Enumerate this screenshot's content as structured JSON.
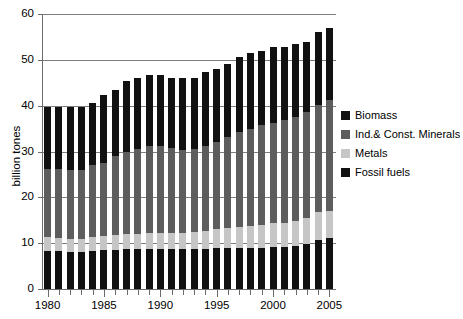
{
  "figure": {
    "title_cropped": "",
    "background": "#ffffff"
  },
  "chart_data": {
    "type": "bar",
    "stacked": true,
    "title": "",
    "xlabel": "",
    "ylabel": "billion tones",
    "ylim": [
      0,
      60
    ],
    "yticks": [
      0,
      10,
      20,
      30,
      40,
      50,
      60
    ],
    "ytick_labels": [
      "0",
      "10",
      "20",
      "30",
      "40",
      "50",
      "60"
    ],
    "grid": true,
    "grid_axis": "y",
    "legend_position": "right",
    "xlim": [
      1979.5,
      2005.5
    ],
    "categories": [
      "1980",
      "1981",
      "1982",
      "1983",
      "1984",
      "1985",
      "1986",
      "1987",
      "1988",
      "1989",
      "1990",
      "1991",
      "1992",
      "1993",
      "1994",
      "1995",
      "1996",
      "1997",
      "1998",
      "1999",
      "2000",
      "2001",
      "2002",
      "2003",
      "2004",
      "2005"
    ],
    "xtick_labels": [
      "1980",
      "1985",
      "1990",
      "1995",
      "2000",
      "2005"
    ],
    "xtick_label_years": [
      1980,
      1985,
      1990,
      1995,
      2000,
      2005
    ],
    "series": [
      {
        "name": "Fossil fuels",
        "color": "#111111",
        "values": [
          8.2,
          8.2,
          8.1,
          8.1,
          8.4,
          8.5,
          8.6,
          8.7,
          8.8,
          8.8,
          8.8,
          8.7,
          8.7,
          8.7,
          8.8,
          8.9,
          9.0,
          9.0,
          8.9,
          8.9,
          9.1,
          9.2,
          9.4,
          9.8,
          10.6,
          11.1
        ]
      },
      {
        "name": "Metals",
        "color": "#c6c6c6",
        "values": [
          3.1,
          3.0,
          2.9,
          2.9,
          3.0,
          3.0,
          3.1,
          3.2,
          3.3,
          3.4,
          3.5,
          3.5,
          3.6,
          3.7,
          3.9,
          4.1,
          4.3,
          4.6,
          4.8,
          5.0,
          5.2,
          5.3,
          5.5,
          5.8,
          6.1,
          6.0
        ]
      },
      {
        "name": "Ind.& Const. Minerals",
        "color": "#5d5d5d",
        "values": [
          14.9,
          14.9,
          14.9,
          14.9,
          15.6,
          16.0,
          17.3,
          18.0,
          18.4,
          18.9,
          18.8,
          18.5,
          18.1,
          18.1,
          18.6,
          19.1,
          19.9,
          20.6,
          21.3,
          21.8,
          22.0,
          22.3,
          22.7,
          23.0,
          23.5,
          24.2
        ]
      },
      {
        "name": "Biomass",
        "color": "#111111",
        "values": [
          13.5,
          13.6,
          13.9,
          13.9,
          13.6,
          14.9,
          14.5,
          15.5,
          15.5,
          15.7,
          15.7,
          15.4,
          15.7,
          15.5,
          16.0,
          16.0,
          15.8,
          16.5,
          16.5,
          16.3,
          16.4,
          16.1,
          15.8,
          15.4,
          15.8,
          15.7
        ]
      }
    ],
    "totals": [
      39.7,
      39.7,
      39.8,
      39.8,
      40.6,
      42.4,
      43.5,
      45.4,
      46.0,
      46.8,
      46.8,
      46.1,
      46.1,
      46.0,
      47.3,
      48.1,
      49.0,
      50.7,
      51.5,
      52.0,
      52.7,
      52.9,
      53.4,
      54.0,
      56.0,
      57.0
    ]
  },
  "legend": {
    "items": [
      {
        "label": "Biomass",
        "color": "#111111",
        "key": "biomass"
      },
      {
        "label": "Ind.& Const. Minerals",
        "color": "#5d5d5d",
        "key": "minerals"
      },
      {
        "label": "Metals",
        "color": "#c6c6c6",
        "key": "metals"
      },
      {
        "label": "Fossil fuels",
        "color": "#111111",
        "key": "fossil"
      }
    ]
  }
}
